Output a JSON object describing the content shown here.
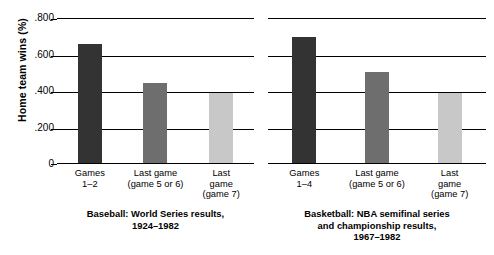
{
  "chart_data": {
    "type": "bar",
    "title": "",
    "xlabel": "",
    "ylabel": "Home team wins (%)",
    "ylim": [
      0,
      0.8
    ],
    "yticks": [
      ".800",
      ".600",
      ".400",
      ".200",
      "0"
    ],
    "ytick_values": [
      0.8,
      0.6,
      0.4,
      0.2,
      0
    ],
    "grid": true,
    "legend": "none",
    "panels": [
      {
        "caption": [
          "Baseball: World Series results,",
          "1924–1982"
        ],
        "categories": [
          [
            "Games",
            "1–2"
          ],
          [
            "Last game",
            "(game 5 or 6)"
          ],
          [
            "Last",
            "game",
            "(game 7)"
          ]
        ],
        "values": [
          0.65,
          0.44,
          0.385
        ],
        "colors": [
          "#333333",
          "#6e6e6e",
          "#c8c8c8"
        ]
      },
      {
        "caption": [
          "Basketball: NBA semifinal series",
          "and championship results,",
          "1967–1982"
        ],
        "categories": [
          [
            "Games",
            "1–4"
          ],
          [
            "Last game",
            "(game 5 or 6)"
          ],
          [
            "Last",
            "game",
            "(game 7)"
          ]
        ],
        "values": [
          0.69,
          0.5,
          0.385
        ],
        "colors": [
          "#333333",
          "#6e6e6e",
          "#c8c8c8"
        ]
      }
    ]
  }
}
